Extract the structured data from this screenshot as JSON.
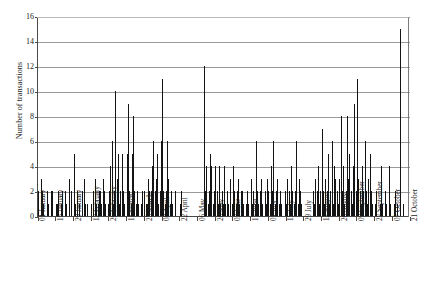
{
  "chart_data": {
    "type": "bar",
    "title": "",
    "xlabel": "",
    "ylabel": "Number of transactions",
    "ylim": [
      0,
      16
    ],
    "yticks": [
      0,
      2,
      4,
      6,
      8,
      10,
      12,
      14,
      16
    ],
    "grid": true,
    "legend": null,
    "bar_color": "#141414",
    "axis_color": "#4a4a4a",
    "grid_color": "#9a9a9a",
    "tick_labels": [
      "01 January",
      "15 January",
      "29 January",
      "12 February",
      "26 February",
      "11 March",
      "25 March",
      "08 April",
      "22 April",
      "06 May",
      "20 May",
      "03 June",
      "17 June",
      "01 July",
      "15 July",
      "29 July",
      "12 August",
      "26 August",
      "09 September",
      "23 September",
      "07 October",
      "21 October",
      "04 November",
      "18 November",
      "02 December",
      "16 December",
      "30 December"
    ],
    "tick_label_interval": 14,
    "values": [
      2,
      0,
      3,
      2,
      1,
      0,
      0,
      2,
      1,
      0,
      2,
      2,
      0,
      0,
      1,
      1,
      2,
      0,
      1,
      2,
      0,
      2,
      1,
      0,
      3,
      0,
      2,
      0,
      5,
      1,
      0,
      2,
      1,
      0,
      0,
      2,
      3,
      1,
      0,
      1,
      0,
      0,
      1,
      2,
      0,
      3,
      1,
      1,
      2,
      2,
      1,
      3,
      2,
      1,
      0,
      1,
      2,
      4,
      6,
      1,
      2,
      10,
      3,
      5,
      1,
      2,
      5,
      2,
      1,
      0,
      5,
      9,
      2,
      1,
      5,
      8,
      2,
      1,
      2,
      1,
      0,
      1,
      2,
      0,
      2,
      1,
      1,
      3,
      2,
      2,
      4,
      6,
      2,
      3,
      5,
      1,
      2,
      6,
      11,
      2,
      1,
      2,
      6,
      3,
      1,
      2,
      1,
      0,
      2,
      0,
      0,
      0,
      1,
      2,
      0,
      0,
      0,
      0,
      0,
      0,
      0,
      0,
      0,
      0,
      0,
      0,
      0,
      0,
      0,
      0,
      0,
      12,
      2,
      4,
      1,
      2,
      5,
      4,
      1,
      2,
      4,
      2,
      1,
      4,
      1,
      2,
      1,
      4,
      1,
      2,
      1,
      0,
      3,
      1,
      4,
      2,
      1,
      2,
      3,
      1,
      2,
      2,
      1,
      0,
      1,
      2,
      1,
      0,
      3,
      1,
      2,
      1,
      6,
      2,
      1,
      2,
      3,
      1,
      0,
      2,
      1,
      3,
      2,
      1,
      4,
      2,
      6,
      1,
      2,
      3,
      1,
      2,
      1,
      0,
      0,
      2,
      1,
      3,
      2,
      1,
      4,
      2,
      1,
      2,
      6,
      1,
      3,
      2,
      1,
      0,
      0,
      0,
      0,
      0,
      0,
      0,
      0,
      2,
      1,
      3,
      2,
      4,
      1,
      2,
      7,
      2,
      1,
      3,
      2,
      5,
      1,
      2,
      6,
      1,
      4,
      3,
      2,
      1,
      3,
      8,
      2,
      4,
      1,
      2,
      8,
      3,
      5,
      2,
      1,
      4,
      9,
      2,
      11,
      3,
      2,
      1,
      4,
      2,
      6,
      2,
      1,
      3,
      5,
      2,
      1,
      0,
      1,
      2,
      0,
      0,
      1,
      4,
      1,
      0,
      2,
      1,
      0,
      4,
      1,
      0,
      0,
      1,
      2,
      0,
      1,
      0,
      15,
      0,
      1,
      0,
      0,
      0,
      0,
      0
    ]
  }
}
